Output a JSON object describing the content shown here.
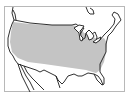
{
  "map": {
    "subject": "United States range map",
    "region_label": "Shaded range covering most of the contiguous United States",
    "colors": {
      "background": "#ffffff",
      "frame": "#b8b8b8",
      "outline": "#1a1a1a",
      "range_fill": "#c4c4c4"
    },
    "frame": {
      "x": 4,
      "y": 6,
      "width": 120,
      "height": 85
    }
  }
}
